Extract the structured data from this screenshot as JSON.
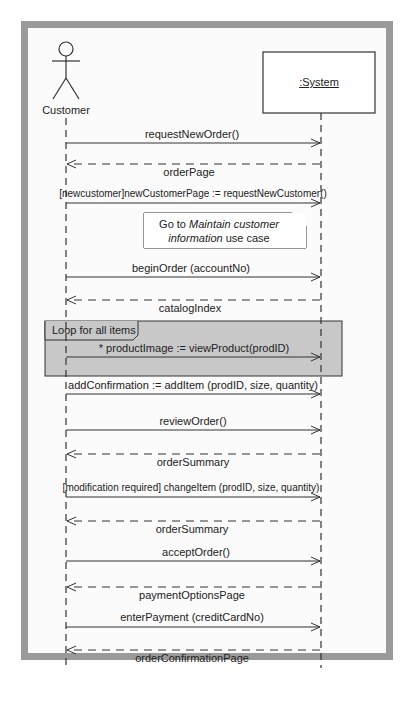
{
  "diagram": {
    "type": "UML sequence diagram",
    "colors": {
      "frame": "#9a9a9a",
      "canvas": "#fbfbfb",
      "loop_fill": "#c8c8c8",
      "line": "#333333"
    },
    "actor": {
      "label": "Customer"
    },
    "system": {
      "label": ":System"
    },
    "note": {
      "prefix": "Go to ",
      "italic1": "Maintain customer",
      "italic2": "information",
      "suffix": " use case"
    },
    "loop": {
      "label": "Loop for all items"
    },
    "messages": [
      {
        "label": "requestNewOrder()",
        "kind": "call"
      },
      {
        "label": "orderPage",
        "kind": "return"
      },
      {
        "label": "[newcustomer]newCustomerPage := requestNewCustomer()",
        "kind": "call"
      },
      {
        "label": "beginOrder (accountNo)",
        "kind": "call"
      },
      {
        "label": "catalogIndex",
        "kind": "return"
      },
      {
        "label": "* productImage := viewProduct(prodID)",
        "kind": "call"
      },
      {
        "label": "addConfirmation := addItem (prodID, size, quantity)",
        "kind": "call"
      },
      {
        "label": "reviewOrder()",
        "kind": "call"
      },
      {
        "label": "orderSummary",
        "kind": "return"
      },
      {
        "label": "[modification required] changeItem (prodID, size, quantity)",
        "kind": "call"
      },
      {
        "label": "orderSummary",
        "kind": "return"
      },
      {
        "label": "acceptOrder()",
        "kind": "call"
      },
      {
        "label": "paymentOptionsPage",
        "kind": "return"
      },
      {
        "label": "enterPayment (creditCardNo)",
        "kind": "call"
      },
      {
        "label": "orderConfirmationPage",
        "kind": "return"
      }
    ]
  }
}
